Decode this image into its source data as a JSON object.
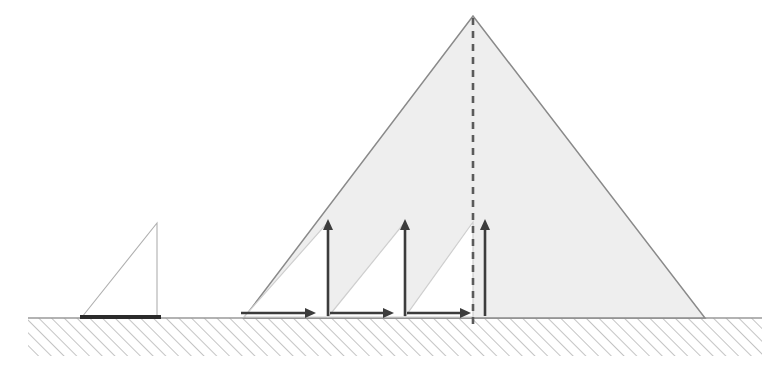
{
  "figure": {
    "canvas": {
      "width": 769,
      "height": 379,
      "background": "#ffffff"
    }
  },
  "colors": {
    "ground_hatch": "#b9b9b9",
    "ground_surface_line": "#9a9a9a",
    "pyramid_fill": "#eeeeee",
    "pyramid_outline": "#8a8a8a",
    "small_triangle_outline": "#b0b0b0",
    "inner_triangle_outline": "#cfcfcf",
    "arrow_stroke": "#3c3c3c",
    "centerline_dash": "#5a5a5a",
    "thick_base_line": "#2b2b2b"
  },
  "ground": {
    "name": "hatched-ground",
    "surface_y": 318,
    "x_start": 28,
    "x_end": 762,
    "depth": 38,
    "hatch_spacing": 9,
    "hatch_angle_deg": 45
  },
  "small_wedge": {
    "name": "small-triangle",
    "apex": {
      "x": 157,
      "y": 223
    },
    "base_left": {
      "x": 82,
      "y": 317
    },
    "base_right": {
      "x": 157,
      "y": 317
    },
    "base_thick_line": {
      "x1": 80,
      "x2": 161,
      "y": 317,
      "thickness": 4
    },
    "filled": false
  },
  "pyramid": {
    "name": "large-triangle",
    "apex": {
      "x": 473,
      "y": 16
    },
    "base_left": {
      "x": 244,
      "y": 318
    },
    "base_right": {
      "x": 705,
      "y": 318
    },
    "filled": true
  },
  "centerline": {
    "name": "centerline",
    "x": 473,
    "y_top": 18,
    "y_bottom": 325,
    "style": "dashed",
    "dash_pattern": "7 6",
    "width": 2.6
  },
  "inner_wedges": [
    {
      "name": "inner-triangle-1",
      "base_left": {
        "x": 244,
        "y": 317
      },
      "base_right": {
        "x": 328,
        "y": 317
      },
      "apex": {
        "x": 328,
        "y": 222
      }
    },
    {
      "name": "inner-triangle-2",
      "base_left": {
        "x": 328,
        "y": 317
      },
      "base_right": {
        "x": 405,
        "y": 317
      },
      "apex": {
        "x": 405,
        "y": 222
      }
    },
    {
      "name": "inner-triangle-3",
      "base_left": {
        "x": 405,
        "y": 317
      },
      "base_right": {
        "x": 473,
        "y": 317
      },
      "apex": {
        "x": 473,
        "y": 222
      }
    }
  ],
  "vertical_arrows": [
    {
      "name": "vertical-arrow-1",
      "x": 328,
      "y_tail": 316,
      "y_head": 219
    },
    {
      "name": "vertical-arrow-2",
      "x": 405,
      "y_tail": 316,
      "y_head": 219
    },
    {
      "name": "vertical-arrow-3",
      "x": 485,
      "y_tail": 316,
      "y_head": 219
    }
  ],
  "horizontal_arrows": [
    {
      "name": "horizontal-arrow-1",
      "y": 313,
      "x_tail": 241,
      "x_head": 316
    },
    {
      "name": "horizontal-arrow-2",
      "y": 313,
      "x_tail": 330,
      "x_head": 394
    },
    {
      "name": "horizontal-arrow-3",
      "y": 313,
      "x_tail": 407,
      "x_head": 471
    }
  ],
  "arrow_head": {
    "length": 11,
    "half_width": 5
  }
}
